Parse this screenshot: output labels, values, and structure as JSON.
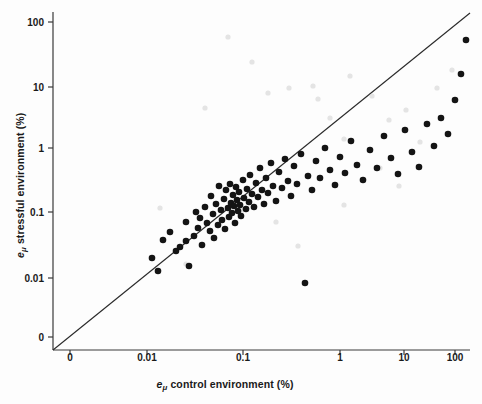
{
  "chart_data": {
    "type": "scatter",
    "title": "",
    "xlabel": "e_mu control environment (%)",
    "ylabel": "e_mu stressful environment (%)",
    "xlabel_parts": {
      "ital": "e",
      "sub": "μ",
      "rest": " control environment (%)"
    },
    "ylabel_parts": {
      "ital": "e",
      "sub": "μ",
      "rest": " stressful environment (%)"
    },
    "x_scale": "log-with-zero-break",
    "y_scale": "log-with-zero-break",
    "xticks": [
      "0",
      "0.01",
      "0.1",
      "1",
      "10",
      "100"
    ],
    "yticks": [
      "100",
      "10",
      "1",
      "0.1",
      "0.01",
      "0"
    ],
    "xtick_px": [
      70,
      147,
      243,
      340,
      404,
      455
    ],
    "ytick_px": [
      22,
      87,
      148,
      212,
      278,
      337
    ],
    "grid": false,
    "legend": "none",
    "reference_line": {
      "label": "1:1 line",
      "color": "#2b2b2b",
      "x_px": [
        53,
        470
      ],
      "y_px": [
        350,
        13
      ]
    },
    "marker_color": "#141414",
    "marker_faint_color": "#cfcfcf",
    "marker_radius_px": 3.3,
    "n_points": 96,
    "points_px": [
      [
        152,
        258
      ],
      [
        158,
        271
      ],
      [
        163,
        240
      ],
      [
        170,
        232
      ],
      [
        176,
        251
      ],
      [
        180,
        247
      ],
      [
        186,
        222
      ],
      [
        186,
        241
      ],
      [
        189,
        266
      ],
      [
        194,
        236
      ],
      [
        196,
        212
      ],
      [
        198,
        228
      ],
      [
        200,
        218
      ],
      [
        202,
        245
      ],
      [
        205,
        207
      ],
      [
        207,
        223
      ],
      [
        210,
        231
      ],
      [
        211,
        196
      ],
      [
        213,
        214
      ],
      [
        214,
        238
      ],
      [
        216,
        204
      ],
      [
        218,
        225
      ],
      [
        219,
        186
      ],
      [
        221,
        210
      ],
      [
        222,
        220
      ],
      [
        224,
        199
      ],
      [
        225,
        229
      ],
      [
        226,
        190
      ],
      [
        228,
        208
      ],
      [
        229,
        217
      ],
      [
        230,
        184
      ],
      [
        231,
        203
      ],
      [
        232,
        213
      ],
      [
        233,
        195
      ],
      [
        234,
        206
      ],
      [
        235,
        223
      ],
      [
        236,
        187
      ],
      [
        237,
        200
      ],
      [
        238,
        211
      ],
      [
        239,
        192
      ],
      [
        240,
        205
      ],
      [
        241,
        216
      ],
      [
        243,
        180
      ],
      [
        244,
        198
      ],
      [
        246,
        209
      ],
      [
        247,
        189
      ],
      [
        249,
        202
      ],
      [
        250,
        175
      ],
      [
        252,
        194
      ],
      [
        254,
        207
      ],
      [
        256,
        183
      ],
      [
        258,
        197
      ],
      [
        260,
        168
      ],
      [
        262,
        190
      ],
      [
        264,
        204
      ],
      [
        266,
        178
      ],
      [
        268,
        193
      ],
      [
        271,
        163
      ],
      [
        273,
        186
      ],
      [
        276,
        201
      ],
      [
        279,
        172
      ],
      [
        282,
        188
      ],
      [
        285,
        159
      ],
      [
        288,
        181
      ],
      [
        291,
        196
      ],
      [
        294,
        166
      ],
      [
        297,
        184
      ],
      [
        301,
        154
      ],
      [
        305,
        283
      ],
      [
        308,
        176
      ],
      [
        312,
        190
      ],
      [
        316,
        161
      ],
      [
        320,
        178
      ],
      [
        325,
        148
      ],
      [
        330,
        170
      ],
      [
        335,
        185
      ],
      [
        340,
        157
      ],
      [
        345,
        173
      ],
      [
        351,
        141
      ],
      [
        357,
        165
      ],
      [
        363,
        180
      ],
      [
        370,
        150
      ],
      [
        377,
        168
      ],
      [
        384,
        136
      ],
      [
        391,
        158
      ],
      [
        398,
        174
      ],
      [
        405,
        130
      ],
      [
        412,
        152
      ],
      [
        419,
        167
      ],
      [
        427,
        124
      ],
      [
        434,
        146
      ],
      [
        441,
        118
      ],
      [
        448,
        134
      ],
      [
        455,
        100
      ],
      [
        461,
        74
      ],
      [
        466,
        40
      ]
    ],
    "faint_points_px": [
      [
        228,
        37
      ],
      [
        252,
        62
      ],
      [
        268,
        93
      ],
      [
        289,
        88
      ],
      [
        313,
        86
      ],
      [
        318,
        99
      ],
      [
        330,
        118
      ],
      [
        344,
        139
      ],
      [
        205,
        108
      ],
      [
        350,
        76
      ],
      [
        372,
        96
      ],
      [
        389,
        120
      ],
      [
        406,
        110
      ],
      [
        420,
        142
      ],
      [
        437,
        88
      ],
      [
        452,
        70
      ],
      [
        160,
        208
      ],
      [
        186,
        264
      ],
      [
        242,
        210
      ],
      [
        276,
        222
      ],
      [
        298,
        246
      ],
      [
        344,
        205
      ],
      [
        380,
        168
      ],
      [
        399,
        186
      ]
    ]
  }
}
